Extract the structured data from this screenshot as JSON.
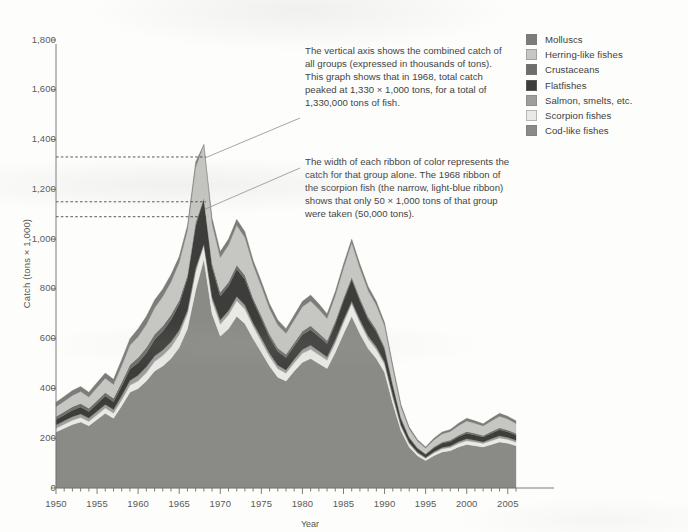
{
  "chart_data": {
    "type": "area",
    "title": "",
    "xlabel": "Year",
    "ylabel": "Catch (tons × 1,000)",
    "stacked": true,
    "xlim": [
      1950,
      2006
    ],
    "ylim": [
      0,
      1800
    ],
    "grid": false,
    "legend_position": "top-right",
    "x_ticks": [
      1950,
      1955,
      1960,
      1965,
      1970,
      1975,
      1980,
      1985,
      1990,
      1995,
      2000,
      2005
    ],
    "y_ticks": [
      0,
      200,
      400,
      600,
      800,
      1000,
      1200,
      1400,
      1600,
      1800
    ],
    "y_tick_labels": [
      "0",
      "200",
      "400",
      "600",
      "800",
      "1,000",
      "1,200",
      "1,400",
      "1,600",
      "1,800"
    ],
    "x_minor_tick_step": 1,
    "reference_lines": [
      {
        "value": 1330,
        "label": "total catch peak 1968"
      },
      {
        "value": 1150,
        "label": "top of scorpion fish ribbon 1968"
      },
      {
        "value": 1090,
        "label": "bottom of scorpion fish ribbon 1968"
      }
    ],
    "x": [
      1950,
      1951,
      1952,
      1953,
      1954,
      1955,
      1956,
      1957,
      1958,
      1959,
      1960,
      1961,
      1962,
      1963,
      1964,
      1965,
      1966,
      1967,
      1968,
      1969,
      1970,
      1971,
      1972,
      1973,
      1974,
      1975,
      1976,
      1977,
      1978,
      1979,
      1980,
      1981,
      1982,
      1983,
      1984,
      1985,
      1986,
      1987,
      1988,
      1989,
      1990,
      1991,
      1992,
      1993,
      1994,
      1995,
      1996,
      1997,
      1998,
      1999,
      2000,
      2001,
      2002,
      2003,
      2004,
      2005,
      2006
    ],
    "series": [
      {
        "name": "Cod-like fishes",
        "color": "#8a8a87",
        "values": [
          225,
          240,
          255,
          265,
          250,
          275,
          300,
          280,
          330,
          385,
          400,
          430,
          470,
          490,
          520,
          565,
          640,
          795,
          920,
          700,
          610,
          640,
          690,
          660,
          600,
          545,
          490,
          445,
          430,
          470,
          505,
          520,
          500,
          480,
          545,
          620,
          690,
          620,
          560,
          520,
          465,
          340,
          230,
          165,
          130,
          110,
          130,
          145,
          150,
          165,
          175,
          170,
          165,
          175,
          185,
          180,
          170
        ]
      },
      {
        "name": "Scorpion fishes",
        "color": "#e9e9e6",
        "values": [
          15,
          16,
          17,
          18,
          17,
          19,
          21,
          20,
          24,
          28,
          30,
          33,
          38,
          42,
          46,
          52,
          60,
          72,
          60,
          52,
          48,
          55,
          62,
          58,
          50,
          44,
          38,
          34,
          31,
          33,
          36,
          37,
          35,
          33,
          38,
          44,
          50,
          44,
          39,
          36,
          32,
          24,
          16,
          12,
          10,
          9,
          11,
          12,
          13,
          14,
          15,
          15,
          14,
          15,
          16,
          15,
          14
        ]
      },
      {
        "name": "Salmon, smelts, etc.",
        "color": "#9e9e9b"
      },
      {
        "name": "Flatfishes",
        "color": "#3d3d3b",
        "values": [
          22,
          24,
          26,
          28,
          26,
          30,
          34,
          32,
          38,
          46,
          50,
          56,
          66,
          76,
          88,
          105,
          130,
          170,
          185,
          120,
          95,
          100,
          110,
          104,
          88,
          76,
          64,
          56,
          50,
          54,
          60,
          62,
          58,
          54,
          64,
          76,
          88,
          76,
          66,
          60,
          52,
          38,
          24,
          18,
          14,
          12,
          15,
          17,
          18,
          20,
          22,
          21,
          20,
          22,
          24,
          23,
          21
        ]
      },
      {
        "name": "Crustaceans",
        "color": "#6e6e6b"
      },
      {
        "name": "Herring-like fishes",
        "color": "#c6c6c2",
        "values": [
          40,
          42,
          45,
          48,
          45,
          52,
          58,
          55,
          66,
          78,
          84,
          92,
          105,
          118,
          132,
          152,
          180,
          220,
          215,
          160,
          140,
          148,
          160,
          152,
          134,
          118,
          102,
          92,
          84,
          90,
          98,
          100,
          95,
          88,
          102,
          120,
          138,
          120,
          106,
          96,
          84,
          62,
          42,
          32,
          26,
          22,
          28,
          32,
          34,
          38,
          42,
          40,
          38,
          42,
          46,
          44,
          40
        ]
      },
      {
        "name": "Molluscs",
        "color": "#7c7c79"
      }
    ],
    "total_values": [
      345,
      368,
      392,
      408,
      385,
      424,
      462,
      437,
      516,
      600,
      640,
      690,
      755,
      800,
      858,
      930,
      1055,
      1310,
      1330,
      1085,
      950,
      1000,
      1080,
      1030,
      915,
      830,
      740,
      675,
      640,
      695,
      750,
      775,
      740,
      700,
      790,
      900,
      1000,
      900,
      810,
      750,
      665,
      495,
      335,
      245,
      195,
      165,
      200,
      225,
      235,
      260,
      280,
      270,
      258,
      280,
      300,
      288,
      270
    ]
  },
  "axes": {
    "y_title": "Catch (tons × 1,000)",
    "x_title": "Year",
    "y_labels": [
      "1,800",
      "1,600",
      "1,400",
      "1,200",
      "1,000",
      "800",
      "600",
      "400",
      "200",
      "0"
    ],
    "x_labels": [
      "1950",
      "1955",
      "1960",
      "1965",
      "1970",
      "1975",
      "1980",
      "1985",
      "1990",
      "1995",
      "2000",
      "2005"
    ]
  },
  "legend": {
    "items": [
      {
        "label": "Molluscs",
        "color": "#7c7c79"
      },
      {
        "label": "Herring-like fishes",
        "color": "#c6c6c2"
      },
      {
        "label": "Crustaceans",
        "color": "#6e6e6b"
      },
      {
        "label": "Flatfishes",
        "color": "#3d3d3b"
      },
      {
        "label": "Salmon, smelts, etc.",
        "color": "#9e9e9b"
      },
      {
        "label": "Scorpion fishes",
        "color": "#e9e9e6"
      },
      {
        "label": "Cod-like fishes",
        "color": "#8a8a87"
      }
    ]
  },
  "annotations": {
    "peak": "The vertical axis shows the combined catch of all groups (expressed in thousands of tons). This graph shows that in 1968, total catch peaked at 1,330 × 1,000 tons, for a total of 1,330,000 tons of fish.",
    "ribbon": "The width of each ribbon of color represents the catch for that group alone. The 1968 ribbon of the scorpion fish (the narrow, light-blue ribbon) shows that only 50 × 1,000 tons of that group were taken (50,000 tons)."
  }
}
